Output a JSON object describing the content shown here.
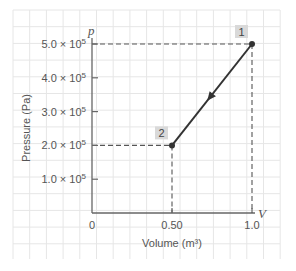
{
  "chart_data": {
    "type": "line",
    "title": "",
    "xlabel": "Volume (m³)",
    "ylabel": "Pressure (Pa)",
    "x_axis_symbol": "V",
    "y_axis_symbol": "p",
    "xlim": [
      0,
      1.0
    ],
    "ylim": [
      0,
      500000
    ],
    "x_ticks": [
      {
        "value": 0,
        "label": "0"
      },
      {
        "value": 0.5,
        "label": "0.50"
      },
      {
        "value": 1.0,
        "label": "1.0"
      }
    ],
    "y_ticks": [
      {
        "value": 100000,
        "label": "1.0 × 10",
        "exp": "5"
      },
      {
        "value": 200000,
        "label": "2.0 × 10",
        "exp": "5"
      },
      {
        "value": 300000,
        "label": "3.0 × 10",
        "exp": "5"
      },
      {
        "value": 400000,
        "label": "4.0 × 10",
        "exp": "5"
      },
      {
        "value": 500000,
        "label": "5.0 × 10",
        "exp": "5"
      }
    ],
    "grid": true,
    "legend": null,
    "series": [
      {
        "name": "process 1→2",
        "x": [
          1.0,
          0.5
        ],
        "y": [
          500000,
          200000
        ],
        "direction": "from 1 to 2",
        "color": "#333333"
      }
    ],
    "points": [
      {
        "label": "1",
        "x": 1.0,
        "y": 500000
      },
      {
        "label": "2",
        "x": 0.5,
        "y": 200000
      }
    ],
    "guides": [
      {
        "type": "dashed",
        "from": [
          0,
          500000
        ],
        "to": [
          1.0,
          500000
        ]
      },
      {
        "type": "dashed",
        "from": [
          1.0,
          500000
        ],
        "to": [
          1.0,
          0
        ]
      },
      {
        "type": "dashed",
        "from": [
          0,
          200000
        ],
        "to": [
          0.5,
          200000
        ]
      },
      {
        "type": "dashed",
        "from": [
          0.5,
          200000
        ],
        "to": [
          0.5,
          0
        ]
      }
    ]
  },
  "colors": {
    "grid": "#e6e6e6",
    "axis": "#666666",
    "line": "#333333",
    "label_box": "#d9d9d9",
    "text": "#555555"
  }
}
